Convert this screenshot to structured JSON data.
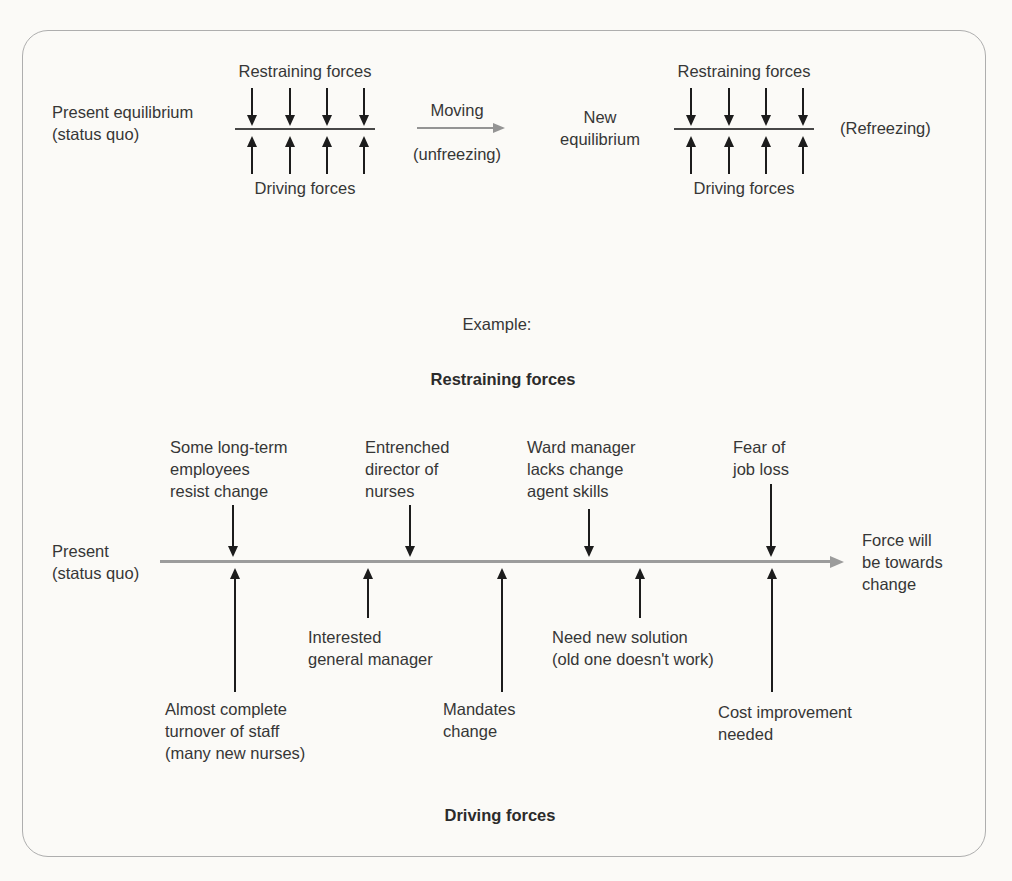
{
  "colors": {
    "background": "#fbfaf7",
    "text": "#363636",
    "black_arrow": "#1c1c1c",
    "gray_arrow": "#9c9c9c",
    "equilibrium_line": "#474747",
    "figure_border": "#aeaeae"
  },
  "lewin_model": {
    "present": {
      "lines": [
        "Present equilibrium",
        "(status quo)"
      ]
    },
    "left_cluster": {
      "top_label": "Restraining forces",
      "bottom_label": "Driving forces"
    },
    "transition": {
      "top_label": "Moving",
      "bottom_label": "(unfreezing)"
    },
    "new_equilibrium": {
      "lines": [
        "New",
        "equilibrium"
      ]
    },
    "right_cluster": {
      "top_label": "Restraining forces",
      "bottom_label": "Driving forces"
    },
    "refreezing_label": "(Refreezing)"
  },
  "example": {
    "heading": "Example:",
    "restraining_heading": "Restraining forces",
    "driving_heading": "Driving forces",
    "present": {
      "lines": [
        "Present",
        "(status quo)"
      ]
    },
    "outcome": {
      "lines": [
        "Force will",
        "be towards",
        "change"
      ]
    },
    "restraining_forces": [
      {
        "lines": [
          "Some long-term",
          "employees",
          "resist change"
        ]
      },
      {
        "lines": [
          "Entrenched",
          "director of",
          "nurses"
        ]
      },
      {
        "lines": [
          "Ward manager",
          "lacks change",
          "agent skills"
        ]
      },
      {
        "lines": [
          "Fear of",
          "job loss"
        ]
      }
    ],
    "driving_forces": [
      {
        "lines": [
          "Almost complete",
          "turnover of staff",
          "(many new nurses)"
        ]
      },
      {
        "lines": [
          "Interested",
          "general manager"
        ]
      },
      {
        "lines": [
          "Mandates",
          "change"
        ]
      },
      {
        "lines": [
          "Need new solution",
          "(old one doesn't work)"
        ]
      },
      {
        "lines": [
          "Cost improvement",
          "needed"
        ]
      }
    ]
  }
}
